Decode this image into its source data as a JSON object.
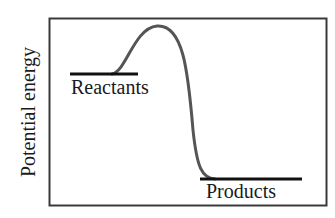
{
  "diagram": {
    "type": "energy-profile",
    "y_axis_label": "Potential energy",
    "reactants_label": "Reactants",
    "products_label": "Products",
    "colors": {
      "frame": "#3a3a3a",
      "curve": "#555555",
      "levels": "#111111",
      "text": "#1a1a1a"
    }
  }
}
